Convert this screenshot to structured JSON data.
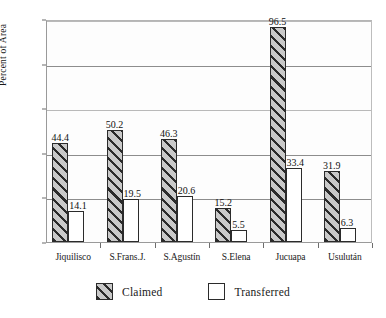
{
  "chart_data": {
    "type": "bar",
    "title": "",
    "subtitle": "",
    "xlabel": "",
    "ylabel": "Percent of Area",
    "ylim": [
      0,
      100
    ],
    "yticks": [
      0,
      20,
      40,
      60,
      80,
      100
    ],
    "grid": true,
    "legend_position": "bottom",
    "categories": [
      "Jiquilisco",
      "S.Frans.J.",
      "S.Agustín",
      "S.Elena",
      "Jucuapa",
      "Usulután"
    ],
    "series": [
      {
        "name": "Claimed",
        "color": "#c6c6c6",
        "pattern": "diagonal-hatch",
        "values": [
          44.4,
          50.2,
          46.3,
          15.2,
          96.5,
          31.9
        ],
        "labels": [
          "44.4",
          "50.2",
          "46.3",
          "15.2",
          "96.5",
          "31.9"
        ]
      },
      {
        "name": "Transferred",
        "color": "#ffffff",
        "pattern": "solid",
        "values": [
          14.1,
          19.5,
          20.6,
          5.5,
          33.4,
          6.3
        ],
        "labels": [
          "14.1",
          "19.5",
          "20.6",
          "5.5",
          "33.4",
          "6.3"
        ]
      }
    ],
    "ytick_labels": [
      "0",
      "20",
      "40",
      "60",
      "80",
      "100"
    ]
  },
  "legend": {
    "items": [
      {
        "label": "Claimed",
        "swatch": "hatched-square"
      },
      {
        "label": "Transferred",
        "swatch": "empty-square"
      }
    ]
  }
}
